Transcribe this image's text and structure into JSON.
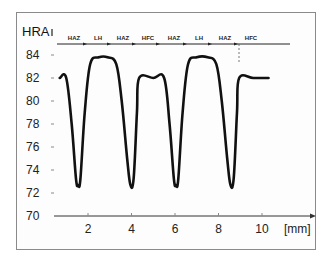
{
  "chart_data": {
    "type": "line",
    "title": "",
    "xlabel": "[mm]",
    "ylabel": "HRA",
    "xlim": [
      0.7,
      12.2
    ],
    "ylim": [
      70,
      84
    ],
    "x_ticks": [
      "2",
      "4",
      "6",
      "8",
      "10"
    ],
    "y_ticks": [
      "84",
      "82",
      "80",
      "78",
      "76",
      "74",
      "72",
      "70"
    ],
    "grid": false,
    "legend": null,
    "zone_labels": [
      "HAZ",
      "LH",
      "HAZ",
      "HFC",
      "HAZ",
      "LH",
      "HAZ",
      "HFC"
    ],
    "series": [
      {
        "name": "hardness",
        "x": [
          0.7,
          1.0,
          1.25,
          1.45,
          1.55,
          1.65,
          1.85,
          2.1,
          2.5,
          2.9,
          3.3,
          3.55,
          3.8,
          3.95,
          4.1,
          4.25,
          4.35,
          5.0,
          5.5,
          5.75,
          5.95,
          6.05,
          6.15,
          6.35,
          6.6,
          7.0,
          7.5,
          7.9,
          8.15,
          8.4,
          8.55,
          8.7,
          8.85,
          8.95,
          9.6,
          10.3
        ],
        "values": [
          82,
          82,
          78,
          73.2,
          72.7,
          73.2,
          79,
          83.2,
          83.8,
          83.8,
          83.2,
          80,
          75,
          72.7,
          73.3,
          79,
          82,
          82,
          82,
          78,
          73.2,
          72.7,
          73.2,
          79,
          83.2,
          83.8,
          83.8,
          83.2,
          80,
          75,
          72.7,
          73.3,
          79,
          82,
          82,
          82
        ]
      }
    ]
  },
  "labels": {
    "hra": "HRA",
    "unit": "[mm]",
    "zones": [
      "HAZ",
      "LH",
      "HAZ",
      "HFC",
      "HAZ",
      "LH",
      "HAZ",
      "HFC"
    ]
  }
}
